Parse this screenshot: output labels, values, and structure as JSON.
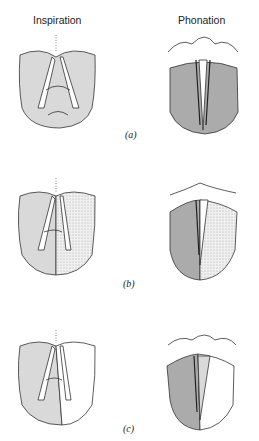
{
  "headers": {
    "left": "Inspiration",
    "right": "Phonation"
  },
  "captions": [
    "(a)",
    "(b)",
    "(c)"
  ],
  "colors": {
    "light": "#d9d9d9",
    "dark": "#ababab",
    "stroke": "#333333",
    "dotted": "#fdf2e0"
  }
}
